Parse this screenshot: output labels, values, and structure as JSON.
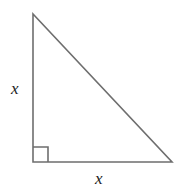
{
  "figure": {
    "type": "right-triangle-diagram",
    "background_color": "#ffffff",
    "stroke_color": "#6e6e6e",
    "label_color": "#1c1c1c",
    "stroke_width": 1.6,
    "vertices": {
      "apex": {
        "x": 33,
        "y": 14
      },
      "right_angle_corner": {
        "x": 33,
        "y": 162
      },
      "bottom_right": {
        "x": 172,
        "y": 162
      }
    },
    "right_angle_marker": {
      "name": "right-angle-square",
      "size": 15,
      "corner_x": 33,
      "corner_y": 162
    },
    "labels": {
      "vertical_leg": "x",
      "horizontal_leg": "x"
    }
  }
}
